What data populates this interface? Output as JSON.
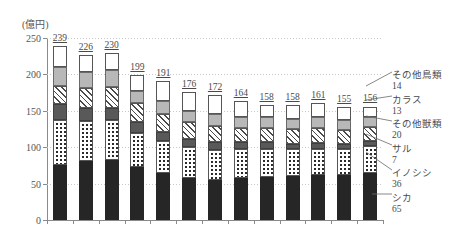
{
  "axis": {
    "unit_label": "(億円)",
    "y_ticks": [
      0,
      50,
      100,
      150,
      200,
      250
    ],
    "y_min": 0,
    "y_max": 250
  },
  "chart_data": {
    "type": "bar",
    "subtype": "stacked-bar",
    "title": "",
    "xlabel": "",
    "ylabel": "(億円)",
    "ylim": [
      0,
      250
    ],
    "grid": true,
    "legend_position": "right-callout",
    "categories": [
      "1",
      "2",
      "3",
      "4",
      "5",
      "6",
      "7",
      "8",
      "9",
      "10",
      "11",
      "12",
      "13"
    ],
    "totals": [
      239,
      226,
      230,
      199,
      191,
      176,
      172,
      164,
      158,
      158,
      161,
      155,
      156
    ],
    "series": [
      {
        "name": "シカ",
        "key": "shika",
        "pattern": "solid-black",
        "color": "#262626",
        "values": [
          75,
          81,
          82,
          73,
          64,
          58,
          55,
          58,
          59,
          61,
          62,
          62,
          65
        ]
      },
      {
        "name": "イノシシ",
        "key": "inoshishi",
        "pattern": "dotted",
        "color": "#ffffff",
        "values": [
          62,
          55,
          55,
          46,
          45,
          42,
          41,
          40,
          39,
          36,
          36,
          35,
          36
        ]
      },
      {
        "name": "サル",
        "key": "saru",
        "pattern": "dark-gray",
        "color": "#595959",
        "values": [
          22,
          18,
          17,
          16,
          12,
          11,
          11,
          9,
          9,
          8,
          8,
          7,
          7
        ]
      },
      {
        "name": "その他獣類",
        "key": "sonotajuu",
        "pattern": "hatched",
        "color": "#ffffff",
        "values": [
          25,
          28,
          29,
          26,
          25,
          23,
          22,
          20,
          20,
          20,
          21,
          20,
          20
        ]
      },
      {
        "name": "カラス",
        "key": "karasu",
        "pattern": "light-gray",
        "color": "#b8b8b8",
        "values": [
          26,
          21,
          23,
          16,
          17,
          16,
          16,
          15,
          14,
          14,
          15,
          13,
          13
        ]
      },
      {
        "name": "その他鳥類",
        "key": "tori",
        "pattern": "white",
        "color": "#ffffff",
        "values": [
          29,
          23,
          24,
          22,
          28,
          26,
          27,
          22,
          17,
          19,
          19,
          18,
          14
        ]
      }
    ]
  },
  "legend": {
    "items": [
      {
        "label": "その他鳥類",
        "value": "14"
      },
      {
        "label": "カラス",
        "value": "13"
      },
      {
        "label": "その他獣類",
        "value": "20"
      },
      {
        "label": "サル",
        "value": "7"
      },
      {
        "label": "イノシシ",
        "value": "36"
      },
      {
        "label": "シカ",
        "value": "65"
      }
    ]
  }
}
